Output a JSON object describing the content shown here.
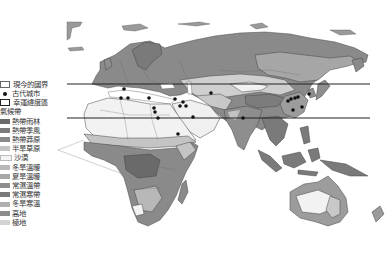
{
  "legend": {
    "items": [
      {
        "label": "現今的國界",
        "type": "border"
      },
      {
        "label": "古代城市",
        "type": "dot"
      },
      {
        "label": "幸運緯度區",
        "type": "zone"
      }
    ],
    "climate_title": "氣候帶",
    "climate": [
      {
        "label": "熱帶雨林",
        "color": "#6a6a6a"
      },
      {
        "label": "熱帶季風",
        "color": "#7c7c7c"
      },
      {
        "label": "熱帶莽原",
        "color": "#8a8a8a"
      },
      {
        "label": "半旱草原",
        "color": "#c4c4c4"
      },
      {
        "label": "沙漠",
        "color": "#f4f4f4"
      },
      {
        "label": "冬旱溫暖",
        "color": "#b8b8b8"
      },
      {
        "label": "夏旱溫暖",
        "color": "#a8a8a8"
      },
      {
        "label": "常濕溫帶",
        "color": "#8e8e8e"
      },
      {
        "label": "常濕寒帶",
        "color": "#7a7a7a"
      },
      {
        "label": "冬旱寒溫",
        "color": "#b0b0b0"
      },
      {
        "label": "高地",
        "color": "#8c8c8c"
      },
      {
        "label": "極地",
        "color": "#d4d4d4"
      }
    ]
  },
  "map": {
    "lucky_latitude_lines": {
      "top_y": 84,
      "bottom_y": 118,
      "x_start": 67,
      "x_end": 370
    }
  }
}
